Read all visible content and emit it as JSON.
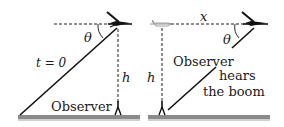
{
  "diagram": {
    "colors": {
      "ink": "#111111",
      "ground": "#8a8a8a",
      "ground_shadow": "#c8c8c8",
      "background": "#ffffff"
    },
    "left_panel": {
      "angle_label": "θ",
      "time_label": "t = 0",
      "height_label": "h",
      "observer_label": "Observer"
    },
    "right_panel": {
      "distance_label": "x",
      "angle_label": "θ",
      "height_label": "h",
      "observer_label": "Observer",
      "event_label_line1": "hears",
      "event_label_line2": "the boom"
    }
  }
}
